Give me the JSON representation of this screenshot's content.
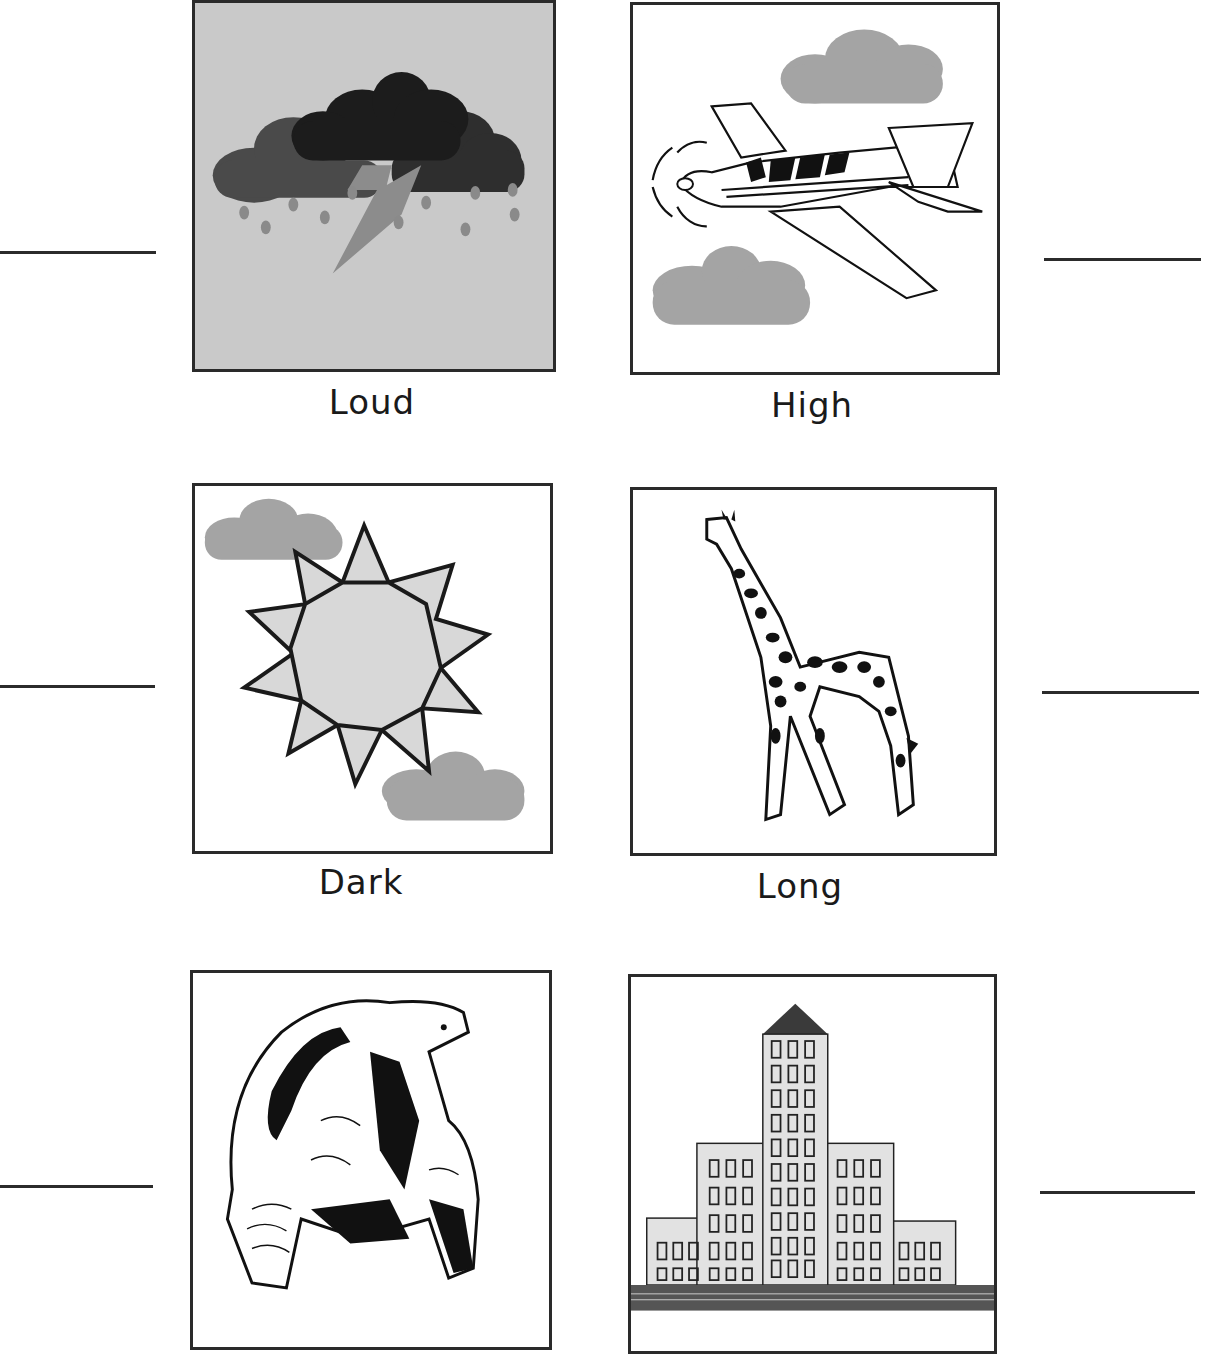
{
  "worksheet": {
    "cards": [
      {
        "id": "storm",
        "picture": "storm-cloud-lightning-rain",
        "label": "Loud"
      },
      {
        "id": "airplane",
        "picture": "airplane-clouds",
        "label": "High"
      },
      {
        "id": "sun",
        "picture": "sun-clouds",
        "label": "Dark"
      },
      {
        "id": "giraffe",
        "picture": "giraffe",
        "label": "Long"
      },
      {
        "id": "tortoise",
        "picture": "tortoise",
        "label": ""
      },
      {
        "id": "buildings",
        "picture": "city-buildings",
        "label": ""
      }
    ],
    "answer_lines": [
      {
        "side": "left",
        "row": 1,
        "value": ""
      },
      {
        "side": "right",
        "row": 1,
        "value": ""
      },
      {
        "side": "left",
        "row": 2,
        "value": ""
      },
      {
        "side": "right",
        "row": 2,
        "value": ""
      },
      {
        "side": "left",
        "row": 3,
        "value": ""
      },
      {
        "side": "right",
        "row": 3,
        "value": ""
      }
    ]
  },
  "colors": {
    "border": "#2a2a2a",
    "storm_bg": "#c9c9c9",
    "cloud_gray": "#a4a4a4",
    "dark_cloud": "#1c1c1c",
    "mid_cloud": "#4a4a4a",
    "sun_fill": "#d8d8d8",
    "road": "#555555"
  }
}
